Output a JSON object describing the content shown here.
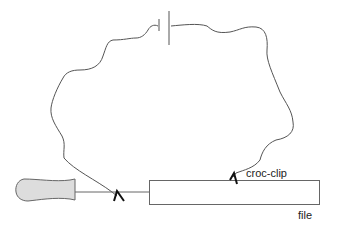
{
  "diagram": {
    "type": "circuit-sketch",
    "labels": {
      "croc_clip": "croc-clip",
      "file": "file"
    },
    "components": [
      {
        "name": "battery",
        "description": "cell symbol at top of wire loop"
      },
      {
        "name": "wire",
        "description": "wavy wire loop connecting battery to two clips"
      },
      {
        "name": "screwdriver",
        "description": "grey handle with metal shaft"
      },
      {
        "name": "croc-clip-left",
        "description": "clip on screwdriver shaft"
      },
      {
        "name": "croc-clip-right",
        "description": "clip on file"
      },
      {
        "name": "file",
        "description": "long rectangular metal file"
      }
    ],
    "colors": {
      "line": "#555555",
      "clip": "#111111",
      "handle_fill": "#dddddd",
      "background": "#ffffff"
    }
  }
}
